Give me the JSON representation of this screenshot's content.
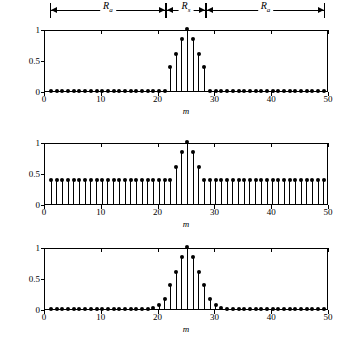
{
  "annotations": {
    "segments": [
      {
        "label": "R",
        "sub": "a",
        "x_start": 1,
        "x_end": 21.5
      },
      {
        "label": "R",
        "sub": "s",
        "x_start": 21.5,
        "x_end": 28.5
      },
      {
        "label": "R",
        "sub": "a",
        "x_start": 28.5,
        "x_end": 49.5
      }
    ]
  },
  "chart_data": [
    {
      "type": "bar",
      "title": "",
      "xlabel": "m",
      "ylabel": "",
      "xlim": [
        0,
        50
      ],
      "ylim": [
        0,
        1
      ],
      "xticks": [
        0,
        10,
        20,
        30,
        40,
        50
      ],
      "xticklabels": [
        "0",
        "10",
        "20",
        "30",
        "40",
        "50"
      ],
      "yticks": [
        0,
        0.5,
        1
      ],
      "yticklabels": [
        "0",
        "0.5",
        "1"
      ],
      "grid": false,
      "legend": "none",
      "x": [
        1,
        2,
        3,
        4,
        5,
        6,
        7,
        8,
        9,
        10,
        11,
        12,
        13,
        14,
        15,
        16,
        17,
        18,
        19,
        20,
        21,
        22,
        23,
        24,
        25,
        26,
        27,
        28,
        29,
        30,
        31,
        32,
        33,
        34,
        35,
        36,
        37,
        38,
        39,
        40,
        41,
        42,
        43,
        44,
        45,
        46,
        47,
        48,
        49
      ],
      "values": [
        0,
        0,
        0,
        0,
        0,
        0,
        0,
        0,
        0,
        0,
        0,
        0,
        0,
        0,
        0,
        0,
        0,
        0,
        0,
        0,
        0,
        0.38,
        0.6,
        0.83,
        1.0,
        0.83,
        0.6,
        0.38,
        0,
        0,
        0,
        0,
        0,
        0,
        0,
        0,
        0,
        0,
        0,
        0,
        0,
        0,
        0,
        0,
        0,
        0,
        0,
        0,
        0
      ]
    },
    {
      "type": "bar",
      "title": "",
      "xlabel": "m",
      "ylabel": "",
      "xlim": [
        0,
        50
      ],
      "ylim": [
        0,
        1
      ],
      "xticks": [
        0,
        10,
        20,
        30,
        40,
        50
      ],
      "xticklabels": [
        "0",
        "10",
        "20",
        "30",
        "40",
        "50"
      ],
      "yticks": [
        0,
        0.5,
        1
      ],
      "yticklabels": [
        "0",
        "0.5",
        "1"
      ],
      "grid": false,
      "legend": "none",
      "x": [
        1,
        2,
        3,
        4,
        5,
        6,
        7,
        8,
        9,
        10,
        11,
        12,
        13,
        14,
        15,
        16,
        17,
        18,
        19,
        20,
        21,
        22,
        23,
        24,
        25,
        26,
        27,
        28,
        29,
        30,
        31,
        32,
        33,
        34,
        35,
        36,
        37,
        38,
        39,
        40,
        41,
        42,
        43,
        44,
        45,
        46,
        47,
        48,
        49
      ],
      "values": [
        0.38,
        0.38,
        0.38,
        0.38,
        0.38,
        0.38,
        0.38,
        0.38,
        0.38,
        0.38,
        0.38,
        0.38,
        0.38,
        0.38,
        0.38,
        0.38,
        0.38,
        0.38,
        0.38,
        0.38,
        0.38,
        0.38,
        0.6,
        0.83,
        1.0,
        0.83,
        0.6,
        0.38,
        0.38,
        0.38,
        0.38,
        0.38,
        0.38,
        0.38,
        0.38,
        0.38,
        0.38,
        0.38,
        0.38,
        0.38,
        0.38,
        0.38,
        0.38,
        0.38,
        0.38,
        0.38,
        0.38,
        0.38,
        0.38
      ]
    },
    {
      "type": "bar",
      "title": "",
      "xlabel": "m",
      "ylabel": "",
      "xlim": [
        0,
        50
      ],
      "ylim": [
        0,
        1
      ],
      "xticks": [
        0,
        10,
        20,
        30,
        40,
        50
      ],
      "xticklabels": [
        "0",
        "10",
        "20",
        "30",
        "40",
        "50"
      ],
      "yticks": [
        0,
        0.5,
        1
      ],
      "yticklabels": [
        "0",
        "0.5",
        "1"
      ],
      "grid": false,
      "legend": "none",
      "x": [
        1,
        2,
        3,
        4,
        5,
        6,
        7,
        8,
        9,
        10,
        11,
        12,
        13,
        14,
        15,
        16,
        17,
        18,
        19,
        20,
        21,
        22,
        23,
        24,
        25,
        26,
        27,
        28,
        29,
        30,
        31,
        32,
        33,
        34,
        35,
        36,
        37,
        38,
        39,
        40,
        41,
        42,
        43,
        44,
        45,
        46,
        47,
        48,
        49
      ],
      "values": [
        0,
        0,
        0,
        0,
        0,
        0,
        0,
        0,
        0,
        0,
        0,
        0,
        0,
        0,
        0,
        0,
        0,
        0,
        0.02,
        0.06,
        0.16,
        0.38,
        0.6,
        0.83,
        1.0,
        0.83,
        0.6,
        0.38,
        0.16,
        0.06,
        0.02,
        0,
        0,
        0,
        0,
        0,
        0,
        0,
        0,
        0,
        0,
        0,
        0,
        0,
        0,
        0,
        0,
        0,
        0
      ]
    }
  ]
}
